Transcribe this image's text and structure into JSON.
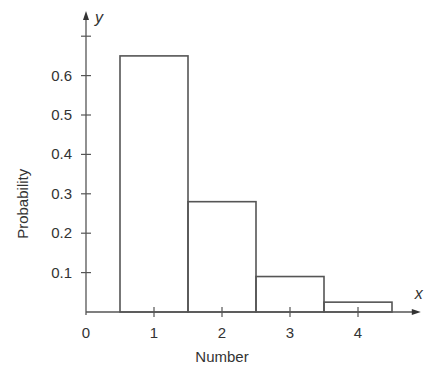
{
  "chart_data": {
    "type": "bar",
    "title": "",
    "xlabel": "Number",
    "ylabel": "Probability",
    "x_axis_symbol": "x",
    "y_axis_symbol": "y",
    "categories": [
      "1",
      "2",
      "3",
      "4"
    ],
    "values": [
      0.65,
      0.28,
      0.09,
      0.025
    ],
    "x_ticks": [
      "0",
      "1",
      "2",
      "3",
      "4"
    ],
    "y_ticks": [
      "0.1",
      "0.2",
      "0.3",
      "0.4",
      "0.5",
      "0.6"
    ],
    "ylim": [
      0,
      0.7
    ],
    "xlim": [
      0,
      4.6
    ],
    "grid": false,
    "legend": null,
    "bar_style": "outlined histogram, adjacent bars of width 1"
  }
}
